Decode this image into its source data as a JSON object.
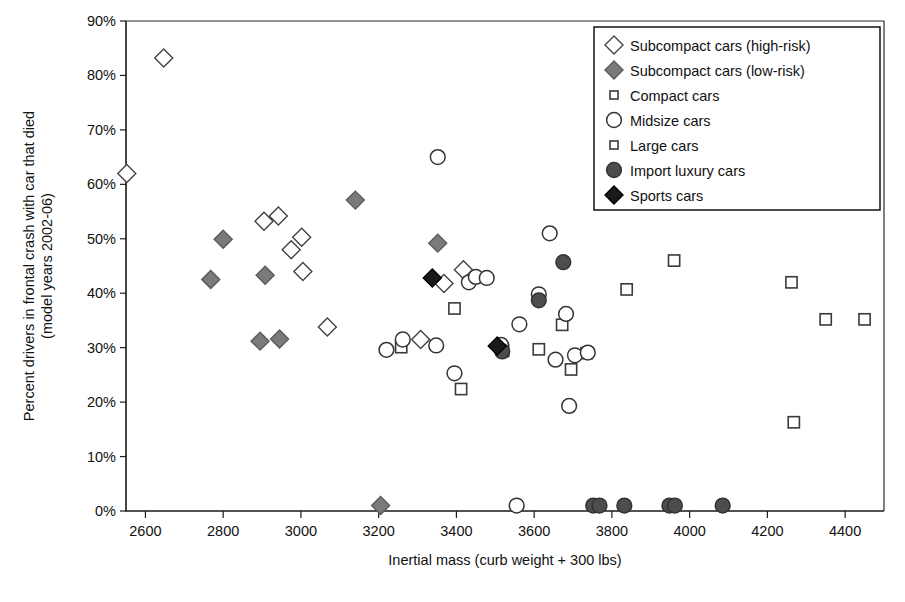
{
  "chart_data": {
    "type": "scatter",
    "title": "",
    "xlabel": "Inertial mass (curb weight + 300 lbs)",
    "ylabel": "Percent drivers in frontal crash with car that died (model years 2002-06)",
    "ylabel_line1": "Percent drivers in frontal crash with car that died",
    "ylabel_line2": "(model years 2002-06)",
    "xlim": [
      2550,
      4500
    ],
    "ylim": [
      0,
      90
    ],
    "grid": false,
    "legend_position": "top-right",
    "xticks": [
      2600,
      2800,
      3000,
      3200,
      3400,
      3600,
      3800,
      4000,
      4200,
      4400
    ],
    "xtick_labels": [
      "2600",
      "2800",
      "3000",
      "3200",
      "3400",
      "3600",
      "3800",
      "4000",
      "4200",
      "4400"
    ],
    "yticks": [
      0,
      10,
      20,
      30,
      40,
      50,
      60,
      70,
      80,
      90
    ],
    "ytick_labels": [
      "0%",
      "10%",
      "20%",
      "30%",
      "40%",
      "50%",
      "60%",
      "70%",
      "80%",
      "90%"
    ],
    "series": [
      {
        "name": "Subcompact cars (high-risk)",
        "marker": "diamond-open",
        "fill": "#ffffff",
        "stroke": "#444444",
        "size": 9,
        "points": [
          [
            2647,
            83.2
          ],
          [
            2552,
            62.0
          ],
          [
            2905,
            53.2
          ],
          [
            2942,
            54.2
          ],
          [
            2975,
            48.0
          ],
          [
            3002,
            50.3
          ],
          [
            3005,
            44.0
          ],
          [
            3068,
            33.8
          ],
          [
            3308,
            31.5
          ],
          [
            3368,
            41.8
          ],
          [
            3418,
            44.3
          ]
        ]
      },
      {
        "name": "Subcompact cars (low-risk)",
        "marker": "diamond-filled",
        "fill": "#7a7a7a",
        "stroke": "#5a5a5a",
        "size": 9,
        "points": [
          [
            2768,
            42.5
          ],
          [
            2800,
            49.9
          ],
          [
            2895,
            31.2
          ],
          [
            2908,
            43.3
          ],
          [
            2945,
            31.6
          ],
          [
            3140,
            57.1
          ],
          [
            3352,
            49.2
          ],
          [
            3205,
            1.0
          ]
        ]
      },
      {
        "name": "Compact cars",
        "marker": "square-open",
        "fill": "#ffffff",
        "stroke": "#3a3a3a",
        "size": 7,
        "points": [
          [
            3258,
            30.1
          ],
          [
            3395,
            37.2
          ],
          [
            3412,
            22.4
          ],
          [
            3520,
            29.4
          ],
          [
            3612,
            29.7
          ],
          [
            3672,
            34.2
          ],
          [
            3695,
            26.0
          ],
          [
            3735,
            29.0
          ]
        ]
      },
      {
        "name": "Midsize cars",
        "marker": "circle-open",
        "fill": "#ffffff",
        "stroke": "#333333",
        "size": 9,
        "points": [
          [
            3220,
            29.6
          ],
          [
            3262,
            31.5
          ],
          [
            3348,
            30.4
          ],
          [
            3352,
            65.0
          ],
          [
            3395,
            25.3
          ],
          [
            3432,
            42.0
          ],
          [
            3450,
            43.0
          ],
          [
            3478,
            42.8
          ],
          [
            3515,
            30.5
          ],
          [
            3562,
            34.3
          ],
          [
            3612,
            39.8
          ],
          [
            3640,
            51.0
          ],
          [
            3655,
            27.8
          ],
          [
            3682,
            36.2
          ],
          [
            3705,
            28.6
          ],
          [
            3738,
            29.1
          ],
          [
            3690,
            19.3
          ],
          [
            3555,
            1.0
          ]
        ]
      },
      {
        "name": "Large cars",
        "marker": "square-open-small",
        "fill": "#ffffff",
        "stroke": "#3a3a3a",
        "size": 7,
        "points": [
          [
            3838,
            40.7
          ],
          [
            3960,
            46.0
          ],
          [
            4262,
            42.0
          ],
          [
            4350,
            35.2
          ],
          [
            4450,
            35.2
          ],
          [
            4268,
            16.3
          ]
        ]
      },
      {
        "name": "Import luxury cars",
        "marker": "circle-filled",
        "fill": "#4d4d4d",
        "stroke": "#333333",
        "size": 9,
        "points": [
          [
            3518,
            29.3
          ],
          [
            3612,
            38.7
          ],
          [
            3675,
            45.7
          ],
          [
            3752,
            1.0
          ],
          [
            3768,
            1.0
          ],
          [
            3832,
            1.0
          ],
          [
            3948,
            1.0
          ],
          [
            3962,
            1.0
          ],
          [
            4085,
            1.0
          ]
        ]
      },
      {
        "name": "Sports cars",
        "marker": "diamond-filled-dark",
        "fill": "#1a1a1a",
        "stroke": "#000000",
        "size": 9,
        "points": [
          [
            3338,
            42.8
          ],
          [
            3505,
            30.3
          ]
        ]
      }
    ],
    "legend": [
      {
        "label": "Subcompact cars (high-risk)",
        "marker": "diamond-open"
      },
      {
        "label": "Subcompact cars (low-risk)",
        "marker": "diamond-filled"
      },
      {
        "label": "Compact cars",
        "marker": "square-open-small"
      },
      {
        "label": "Midsize cars",
        "marker": "circle-open"
      },
      {
        "label": "Large cars",
        "marker": "square-open-small"
      },
      {
        "label": "Import luxury cars",
        "marker": "circle-filled"
      },
      {
        "label": "Sports cars",
        "marker": "diamond-filled-dark"
      }
    ]
  },
  "colors": {
    "axis": "#1a1a1a",
    "text": "#111111",
    "background": "#ffffff",
    "marker_gray": "#7a7a7a",
    "marker_dark": "#4d4d4d",
    "marker_black": "#1a1a1a"
  }
}
